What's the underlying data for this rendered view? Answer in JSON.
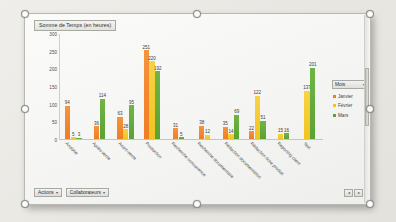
{
  "chart_title": "Somme de Temps (en heures)",
  "legend": {
    "header_label": "Mois",
    "header_caret": "▾",
    "entries": [
      {
        "label": "Janvier",
        "color": "#ef7d23"
      },
      {
        "label": "Février",
        "color": "#f0c51f"
      },
      {
        "label": "Mars",
        "color": "#5aa233"
      }
    ]
  },
  "toolbar": {
    "actions_label": "Actions",
    "actions_caret": "▾",
    "collaborateurs_label": "Collaborateurs",
    "collaborateurs_caret": "▾",
    "corner_left": "◂",
    "corner_right": "▸"
  },
  "chart_data": {
    "type": "bar",
    "title": "Somme de Temps (en heures)",
    "xlabel": "",
    "ylabel": "",
    "ylim": [
      0,
      300
    ],
    "yticks": [
      "0",
      "50",
      "100",
      "150",
      "200",
      "250",
      "300"
    ],
    "grid": false,
    "legend_position": "right",
    "categories": [
      "Analyse",
      "Après-vente",
      "Avant-vente",
      "Production",
      "Recherche concurrence",
      "Recherche documentaire",
      "Rédaction documentation",
      "Rédaction fiche produit",
      "Reporting client",
      "Test"
    ],
    "series": [
      {
        "name": "Janvier",
        "color": "#ef7d23",
        "values": [
          94,
          36,
          63,
          251,
          31,
          38,
          35,
          22,
          null,
          null
        ]
      },
      {
        "name": "Février",
        "color": "#f0c51f",
        "values": [
          5,
          null,
          28,
          220,
          null,
          12,
          14,
          122,
          15,
          137
        ]
      },
      {
        "name": "Mars",
        "color": "#5aa233",
        "values": [
          3,
          114,
          95,
          192,
          5,
          null,
          69,
          51,
          16,
          201
        ]
      }
    ]
  }
}
